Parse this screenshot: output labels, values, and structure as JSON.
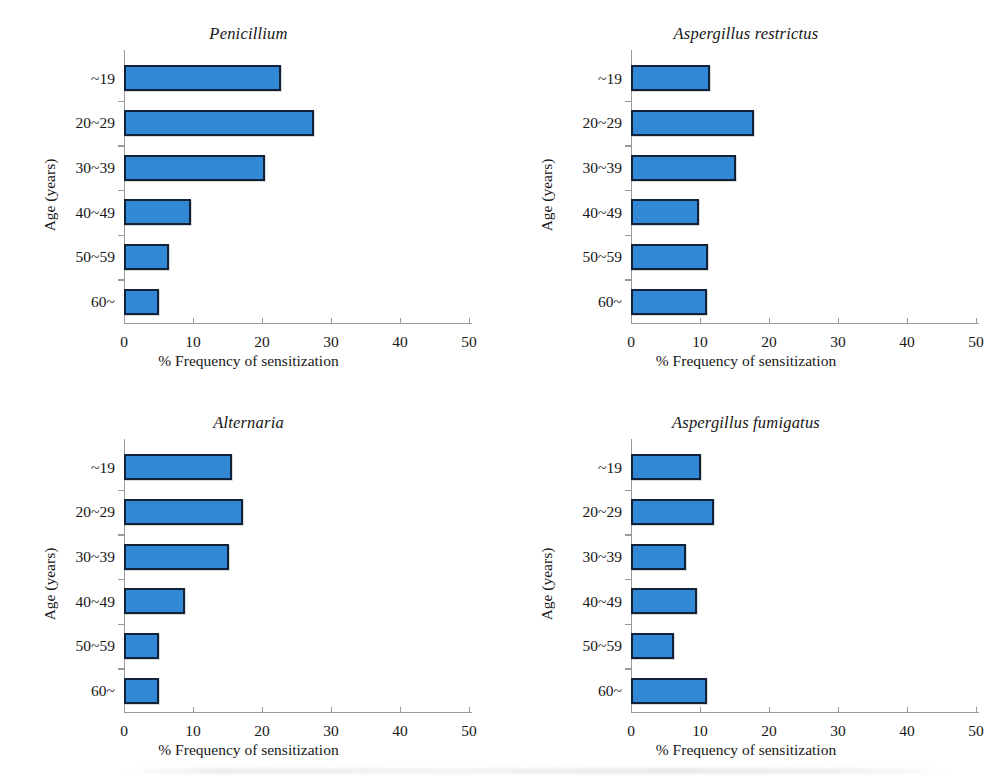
{
  "figure": {
    "background_color": "#ffffff",
    "bar_color": "#3288d4",
    "bar_border_color": "#10213a",
    "axis_color": "#9a9a9a",
    "text_color": "#171717"
  },
  "chart_data": [
    {
      "type": "bar",
      "orientation": "horizontal",
      "title": "Penicillium",
      "xlabel": "% Frequency of sensitization",
      "ylabel": "Age (years)",
      "categories": [
        "~19",
        "20~29",
        "30~39",
        "40~49",
        "50~59",
        "60~"
      ],
      "values": [
        22.7,
        27.5,
        20.5,
        9.7,
        6.5,
        5.0
      ],
      "xlim": [
        0,
        50
      ],
      "xticks": [
        0,
        10,
        20,
        30,
        40,
        50
      ],
      "grid": false,
      "legend": "none"
    },
    {
      "type": "bar",
      "orientation": "horizontal",
      "title": "Aspergillus restrictus",
      "xlabel": "% Frequency of sensitization",
      "ylabel": "Age (years)",
      "categories": [
        "~19",
        "20~29",
        "30~39",
        "40~49",
        "50~59",
        "60~"
      ],
      "values": [
        11.4,
        17.8,
        15.2,
        9.8,
        11.1,
        11.0
      ],
      "xlim": [
        0,
        50
      ],
      "xticks": [
        0,
        10,
        20,
        30,
        40,
        50
      ],
      "grid": false,
      "legend": "none"
    },
    {
      "type": "bar",
      "orientation": "horizontal",
      "title": "Alternaria",
      "xlabel": "% Frequency of sensitization",
      "ylabel": "Age (years)",
      "categories": [
        "~19",
        "20~29",
        "30~39",
        "40~49",
        "50~59",
        "60~"
      ],
      "values": [
        15.6,
        17.3,
        15.2,
        8.8,
        5.1,
        5.1
      ],
      "xlim": [
        0,
        50
      ],
      "xticks": [
        0,
        10,
        20,
        30,
        40,
        50
      ],
      "grid": false,
      "legend": "none"
    },
    {
      "type": "bar",
      "orientation": "horizontal",
      "title": "Aspergillus fumigatus",
      "xlabel": "% Frequency of sensitization",
      "ylabel": "Age (years)",
      "categories": [
        "~19",
        "20~29",
        "30~39",
        "40~49",
        "50~59",
        "60~"
      ],
      "values": [
        10.2,
        12.1,
        7.9,
        9.5,
        6.2,
        11.0
      ],
      "xlim": [
        0,
        50
      ],
      "xticks": [
        0,
        10,
        20,
        30,
        40,
        50
      ],
      "grid": false,
      "legend": "none"
    }
  ]
}
